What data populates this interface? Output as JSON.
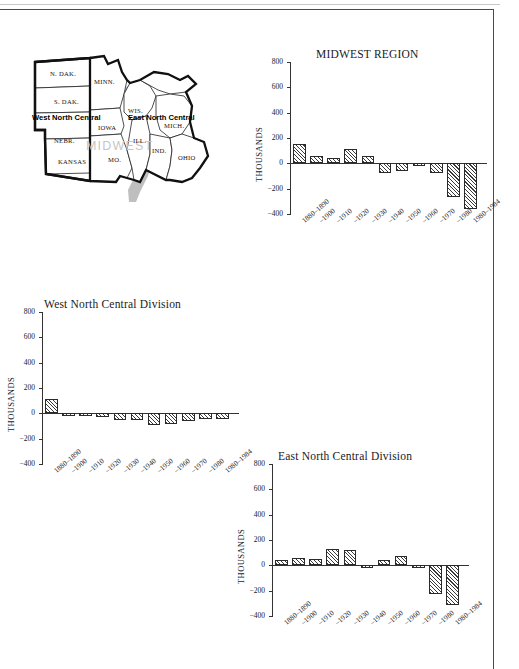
{
  "page": {
    "map": {
      "name": "midwest-region-map",
      "watermark": "MIDWEST",
      "regions": [
        {
          "key": "west",
          "label": "West North Central"
        },
        {
          "key": "east",
          "label": "East North Central"
        }
      ],
      "states": [
        {
          "key": "ndak",
          "label": "N. DAK."
        },
        {
          "key": "minn",
          "label": "MINN."
        },
        {
          "key": "sdak",
          "label": "S. DAK."
        },
        {
          "key": "wis",
          "label": "WIS."
        },
        {
          "key": "mich",
          "label": "MICH."
        },
        {
          "key": "nebr",
          "label": "NEBR."
        },
        {
          "key": "iowa",
          "label": "IOWA"
        },
        {
          "key": "ill",
          "label": "ILL."
        },
        {
          "key": "ind",
          "label": "IND."
        },
        {
          "key": "ohio",
          "label": "OHIO"
        },
        {
          "key": "kansas",
          "label": "KANSAS"
        },
        {
          "key": "mo",
          "label": "MO."
        }
      ]
    }
  },
  "chart_data": [
    {
      "id": "midwest-region",
      "type": "bar",
      "title": "MIDWEST REGION",
      "xlabel": "",
      "ylabel": "THOUSANDS",
      "ylim": [
        -400,
        800
      ],
      "yticks": [
        800,
        600,
        400,
        200,
        0,
        -200,
        -400
      ],
      "ytick_labels": [
        "800",
        "600",
        "400",
        "200",
        "0",
        "−200",
        "−400"
      ],
      "grid": false,
      "legend": "none",
      "categories": [
        "1880–1890",
        "–1900",
        "–1910",
        "–1920",
        "–1930",
        "–1940",
        "–1950",
        "–1960",
        "–1970",
        "–1980",
        "1980–1984"
      ],
      "values": [
        150,
        55,
        45,
        110,
        55,
        -75,
        -60,
        -5,
        -75,
        -265,
        -360
      ]
    },
    {
      "id": "west-north-central-division",
      "type": "bar",
      "title": "West North Central Division",
      "xlabel": "",
      "ylabel": "THOUSANDS",
      "ylim": [
        -400,
        800
      ],
      "yticks": [
        800,
        600,
        400,
        200,
        0,
        -200,
        -400
      ],
      "ytick_labels": [
        "800",
        "600",
        "400",
        "200",
        "0",
        "−200",
        "−400"
      ],
      "grid": false,
      "legend": "none",
      "categories": [
        "1880–1890",
        "–1900",
        "–1910",
        "–1920",
        "–1930",
        "–1940",
        "–1950",
        "–1960",
        "–1970",
        "–1980",
        "1980–1984"
      ],
      "values": [
        110,
        -8,
        -4,
        -30,
        -55,
        -55,
        -95,
        -85,
        -60,
        -45,
        -45
      ]
    },
    {
      "id": "east-north-central-division",
      "type": "bar",
      "title": "East North Central Division",
      "xlabel": "",
      "ylabel": "THOUSANDS",
      "ylim": [
        -400,
        800
      ],
      "yticks": [
        800,
        600,
        400,
        200,
        0,
        -200,
        -400
      ],
      "ytick_labels": [
        "800",
        "600",
        "400",
        "200",
        "0",
        "−200",
        "−400"
      ],
      "grid": false,
      "legend": "none",
      "categories": [
        "1880–1890",
        "–1900",
        "–1910",
        "–1920",
        "–1930",
        "–1940",
        "–1950",
        "–1960",
        "–1970",
        "–1980",
        "1980–1984"
      ],
      "values": [
        40,
        60,
        48,
        130,
        122,
        -10,
        42,
        75,
        -12,
        -228,
        -315
      ]
    }
  ]
}
